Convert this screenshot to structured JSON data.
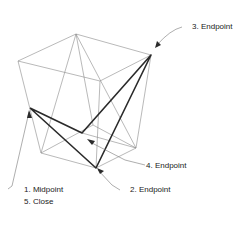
{
  "labels": {
    "endpoint3": "3. Endpoint",
    "endpoint4": "4. Endpoint",
    "endpoint2": "2. Endpoint",
    "midpoint1": "1. Midpoint",
    "close5": "5. Close"
  },
  "colors": {
    "thin_line": "#8a8a8a",
    "thick_line": "#2a2a2a",
    "text": "#222222"
  }
}
